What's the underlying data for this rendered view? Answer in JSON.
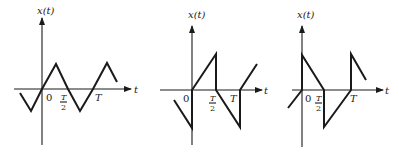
{
  "figure": {
    "panels": [
      {
        "id": "triangle-wave",
        "y_label": "x(t)",
        "x_label": "t",
        "origin_label": "0",
        "half_period_label": {
          "num": "T",
          "den": "2"
        },
        "period_label": "T",
        "waveform": "triangle",
        "points": [
          [
            20,
            93
          ],
          [
            31,
            111
          ],
          [
            42,
            89
          ],
          [
            56,
            64
          ],
          [
            68,
            89
          ],
          [
            80,
            111
          ],
          [
            93,
            89
          ],
          [
            107,
            63
          ],
          [
            117,
            82
          ]
        ]
      },
      {
        "id": "sawtooth-alternating",
        "y_label": "x(t)",
        "x_label": "t",
        "origin_label": "0",
        "half_period_label": {
          "num": "T",
          "den": "2"
        },
        "period_label": "T",
        "waveform": "alternating-ramp",
        "points": [
          [
            174,
            100
          ],
          [
            192,
            128
          ],
          [
            192,
            90
          ],
          [
            216,
            54
          ],
          [
            216,
            90
          ],
          [
            240,
            127
          ],
          [
            240,
            90
          ],
          [
            257,
            64
          ]
        ]
      },
      {
        "id": "sawtooth-decaying",
        "y_label": "x(t)",
        "x_label": "t",
        "origin_label": "0",
        "half_period_label": {
          "num": "T",
          "den": "2"
        },
        "period_label": "T",
        "waveform": "alternating-sawtooth",
        "points": [
          [
            288,
            108
          ],
          [
            302,
            90
          ],
          [
            302,
            55
          ],
          [
            324,
            90
          ],
          [
            324,
            127
          ],
          [
            351,
            90
          ],
          [
            351,
            54
          ],
          [
            366,
            80
          ]
        ]
      }
    ]
  }
}
